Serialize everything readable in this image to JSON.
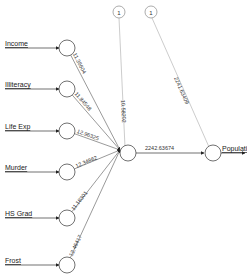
{
  "diagram": {
    "type": "neural-network",
    "inputs": [
      {
        "label": "Income",
        "weight": "11.36604",
        "y": 48
      },
      {
        "label": "Illiteracy",
        "weight": "11.84548",
        "y": 89
      },
      {
        "label": "Life Exp",
        "weight": "12.96325",
        "y": 131
      },
      {
        "label": "Murder",
        "weight": "12.34862",
        "y": 172
      },
      {
        "label": "HS Grad",
        "weight": "11.18301",
        "y": 218
      },
      {
        "label": "Frost",
        "weight": "12.46417",
        "y": 265
      }
    ],
    "bias_nodes": [
      {
        "label": "1",
        "weight": "10.58202"
      },
      {
        "label": "1",
        "weight": "2241.63409"
      }
    ],
    "hidden_to_output_weight": "2242.63674",
    "output": {
      "label": "Population"
    },
    "colors": {
      "line": "#555555",
      "node_stroke": "#333333",
      "bias_line": "#aaaaaa",
      "background": "#ffffff"
    }
  }
}
